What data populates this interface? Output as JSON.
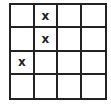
{
  "grid": {
    "rows": 4,
    "cols": 4,
    "mark": "x",
    "cells": [
      [
        "",
        "x",
        "",
        ""
      ],
      [
        "",
        "x",
        "",
        ""
      ],
      [
        "x",
        "",
        "",
        ""
      ],
      [
        "",
        "",
        "",
        ""
      ]
    ]
  },
  "colors": {
    "line": "#222222",
    "background": "#ffffff"
  }
}
